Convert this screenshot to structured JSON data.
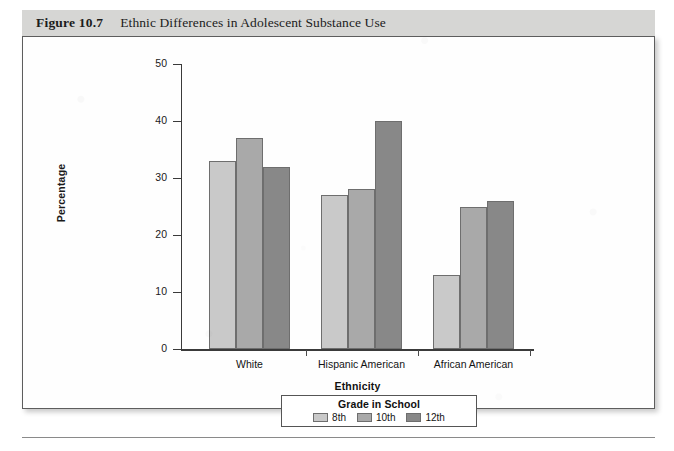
{
  "caption": {
    "figure_number": "Figure 10.7",
    "title": "Ethnic Differences in Adolescent Substance Use"
  },
  "chart_data": {
    "type": "bar",
    "title": "Ethnic Differences in Adolescent Substance Use",
    "categories": [
      "White",
      "Hispanic American",
      "African American"
    ],
    "series": [
      {
        "name": "8th",
        "values": [
          33,
          27,
          13
        ],
        "color": "#c9c9c9"
      },
      {
        "name": "10th",
        "values": [
          37,
          28,
          25
        ],
        "color": "#a9a9a9"
      },
      {
        "name": "12th",
        "values": [
          32,
          40,
          26
        ],
        "color": "#888888"
      }
    ],
    "xlabel": "Ethnicity",
    "ylabel": "Percentage",
    "ylim": [
      0,
      50
    ],
    "yticks": [
      0,
      10,
      20,
      30,
      40,
      50
    ],
    "ytick_labels": [
      "0",
      "10",
      "20",
      "30",
      "40",
      "50"
    ],
    "grid": false,
    "legend_title": "Grade in School",
    "legend_position": "bottom"
  }
}
